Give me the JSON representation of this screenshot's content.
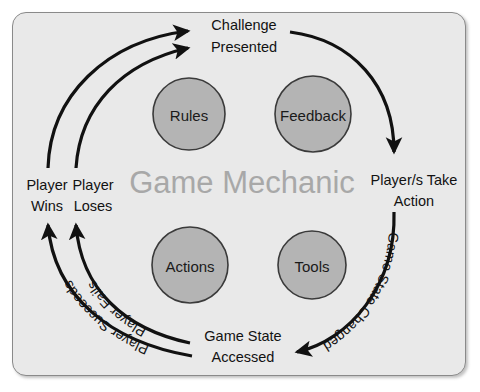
{
  "diagram": {
    "title": "Game Mechanic",
    "frame": {
      "background_color": "#e9e9e9",
      "border_color": "#8a8a8a"
    },
    "nodes": [
      {
        "id": "rules",
        "label": "Rules",
        "cx": 189,
        "cy": 114,
        "r": 36,
        "fill": "#b4b4b4"
      },
      {
        "id": "feedback",
        "label": "Feedback",
        "cx": 313,
        "cy": 114,
        "r": 38,
        "fill": "#b4b4b4"
      },
      {
        "id": "actions",
        "label": "Actions",
        "cx": 190,
        "cy": 265,
        "r": 38,
        "fill": "#b4b4b4"
      },
      {
        "id": "tools",
        "label": "Tools",
        "cx": 312,
        "cy": 265,
        "r": 34,
        "fill": "#b4b4b4"
      }
    ],
    "stages": [
      {
        "id": "challenge-presented",
        "line1": "Challenge",
        "line2": "Presented"
      },
      {
        "id": "players-take-action",
        "line1": "Player/s Take",
        "line2": "Action"
      },
      {
        "id": "game-state-accessed",
        "line1": "Game State",
        "line2": "Accessed"
      },
      {
        "id": "player-wins",
        "line1": "Player",
        "line2": "Wins"
      },
      {
        "id": "player-loses",
        "line1": "Player",
        "line2": "Loses"
      }
    ],
    "transitions": [
      {
        "id": "game-state-changed",
        "label": "Game State Changed"
      },
      {
        "id": "player-succeeds",
        "label": "Player Succeeds"
      },
      {
        "id": "player-fails",
        "label": "Player Fails"
      }
    ],
    "arrow_color": "#111111"
  }
}
